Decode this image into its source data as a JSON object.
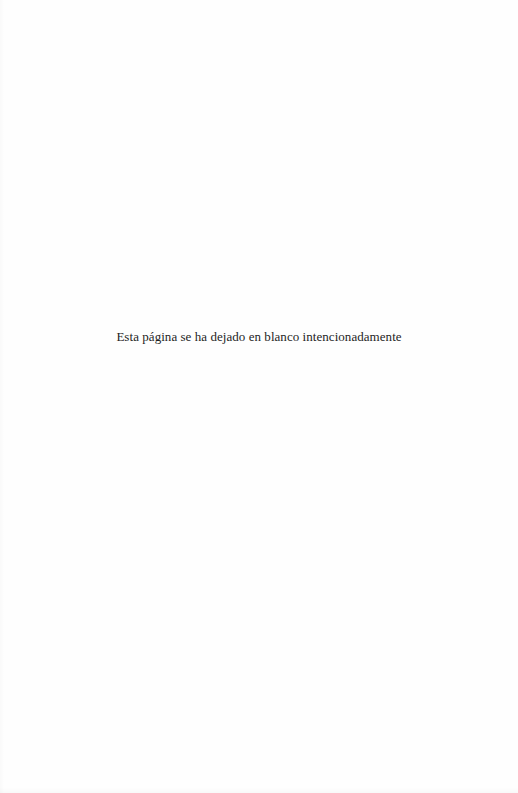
{
  "page": {
    "background_color": "#fefefe",
    "text_color": "#1e1e1e",
    "notice": "Esta página se ha dejado en blanco intencionadamente"
  }
}
